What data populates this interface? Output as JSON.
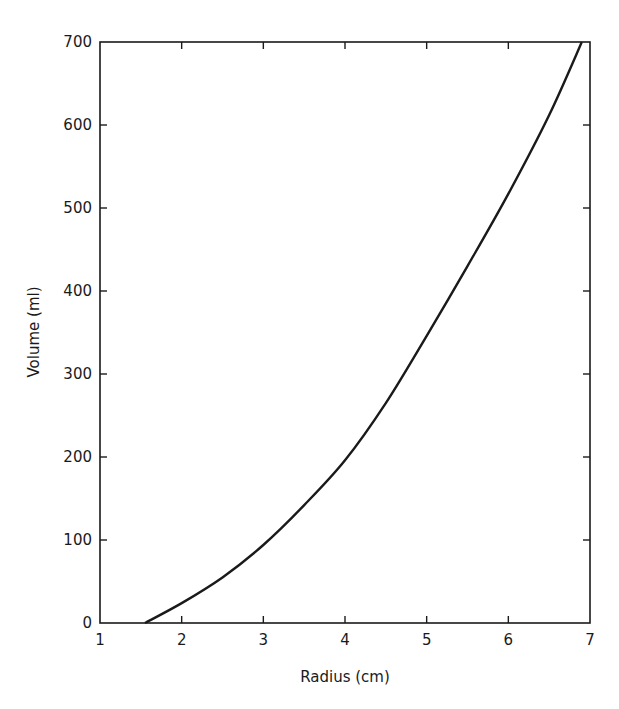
{
  "chart_data": {
    "type": "line",
    "title": "",
    "xlabel": "Radius (cm)",
    "ylabel": "Volume (ml)",
    "xlim": [
      1,
      7
    ],
    "ylim": [
      0,
      700
    ],
    "x_ticks": [
      1,
      2,
      3,
      4,
      5,
      6,
      7
    ],
    "y_ticks": [
      0,
      100,
      200,
      300,
      400,
      500,
      600,
      700
    ],
    "grid": false,
    "legend": null,
    "series": [
      {
        "name": "Volume vs Radius",
        "x": [
          1.55,
          2.0,
          2.5,
          3.0,
          3.5,
          4.0,
          4.5,
          5.0,
          5.5,
          6.0,
          6.5,
          6.9
        ],
        "values": [
          0,
          24,
          55,
          94,
          142,
          196,
          265,
          346,
          430,
          517,
          612,
          700
        ]
      }
    ],
    "colors": {
      "line": "#1a1a1a",
      "axes": "#1a1a1a",
      "background": "#ffffff"
    }
  }
}
